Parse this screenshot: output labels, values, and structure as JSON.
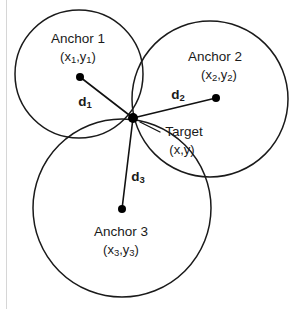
{
  "figure": {
    "background_color": "#ffffff",
    "stroke_color": "#1a1a1a",
    "text_color": "#1a1a1a"
  },
  "anchors": [
    {
      "id": "anchor-1",
      "label": "Anchor 1",
      "coord_open": "(x",
      "coord_sub1": "1",
      "coord_mid": ",y",
      "coord_sub2": "1",
      "coord_close": ")",
      "coord_label": "(x1,y1)",
      "center_x": 79,
      "center_y": 74,
      "radius": 64,
      "dot_x": 80,
      "dot_y": 77,
      "label_x": 78,
      "label_y": 43,
      "coord_x": 78,
      "coord_y": 61
    },
    {
      "id": "anchor-2",
      "label": "Anchor 2",
      "coord_open": "(x",
      "coord_sub1": "2",
      "coord_mid": ",y",
      "coord_sub2": "2",
      "coord_close": ")",
      "coord_label": "(x2,y2)",
      "center_x": 210,
      "center_y": 99,
      "radius": 78,
      "dot_x": 216,
      "dot_y": 98,
      "label_x": 215,
      "label_y": 61,
      "coord_x": 219,
      "coord_y": 79
    },
    {
      "id": "anchor-3",
      "label": "Anchor 3",
      "coord_open": "(x",
      "coord_sub1": "3",
      "coord_mid": ",y",
      "coord_sub2": "3",
      "coord_close": ")",
      "coord_label": "(x3,y3)",
      "center_x": 122,
      "center_y": 208,
      "radius": 89,
      "dot_x": 122,
      "dot_y": 209,
      "label_x": 121,
      "label_y": 236,
      "coord_x": 121,
      "coord_y": 254
    }
  ],
  "target": {
    "id": "target",
    "label": "Target",
    "coord_label": "(x,y)",
    "x": 133,
    "y": 118,
    "label_x": 184,
    "label_y": 136,
    "coord_x": 182,
    "coord_y": 154,
    "leader_from_x": 140,
    "leader_from_y": 122,
    "leader_to_x": 160,
    "leader_to_y": 132
  },
  "distances": [
    {
      "id": "d1",
      "label": "d",
      "subscript": "1",
      "full_label": "d1",
      "from_x": 80,
      "from_y": 77,
      "to_x": 133,
      "to_y": 118,
      "label_x": 85,
      "label_y": 106
    },
    {
      "id": "d2",
      "label": "d",
      "subscript": "2",
      "full_label": "d2",
      "from_x": 216,
      "from_y": 98,
      "to_x": 133,
      "to_y": 118,
      "label_x": 178,
      "label_y": 99
    },
    {
      "id": "d3",
      "label": "d",
      "subscript": "3",
      "full_label": "d3",
      "from_x": 122,
      "from_y": 209,
      "to_x": 133,
      "to_y": 118,
      "label_x": 138,
      "label_y": 181
    }
  ]
}
